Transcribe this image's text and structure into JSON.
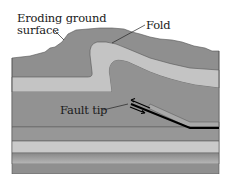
{
  "labels": {
    "eroding_line1": "Eroding ground",
    "eroding_line2": "surface",
    "fold": "Fold",
    "fault_tip": "Fault tip"
  },
  "colors": {
    "dark_layer": "#8f8f8f",
    "light_layer": "#c4c4c4",
    "mid_layer": "#9a9a9a",
    "boundary_line": "#4a4a4a",
    "fault_line": "#000000",
    "background": "#ffffff"
  }
}
